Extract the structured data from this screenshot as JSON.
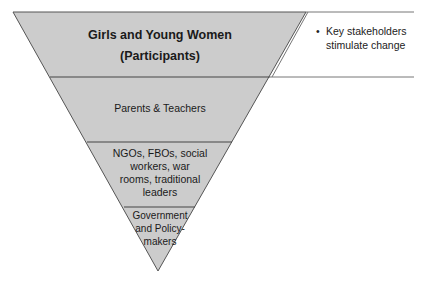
{
  "diagram": {
    "type": "inverted-pyramid",
    "fill_color": "#cccccc",
    "stroke_color": "#555555",
    "layers": [
      {
        "label_line1": "Girls and Young Women",
        "label_line2": "(Participants)",
        "bold": true
      },
      {
        "label": "Parents & Teachers"
      },
      {
        "label_lines": [
          "NGOs, FBOs, social",
          "workers, war",
          "rooms, traditional",
          "leaders"
        ]
      },
      {
        "label_lines": [
          "Government",
          "and Policy-",
          "makers"
        ]
      }
    ],
    "callout": {
      "bullet": "•",
      "lines": [
        "Key stakeholders",
        "stimulate change"
      ]
    }
  }
}
